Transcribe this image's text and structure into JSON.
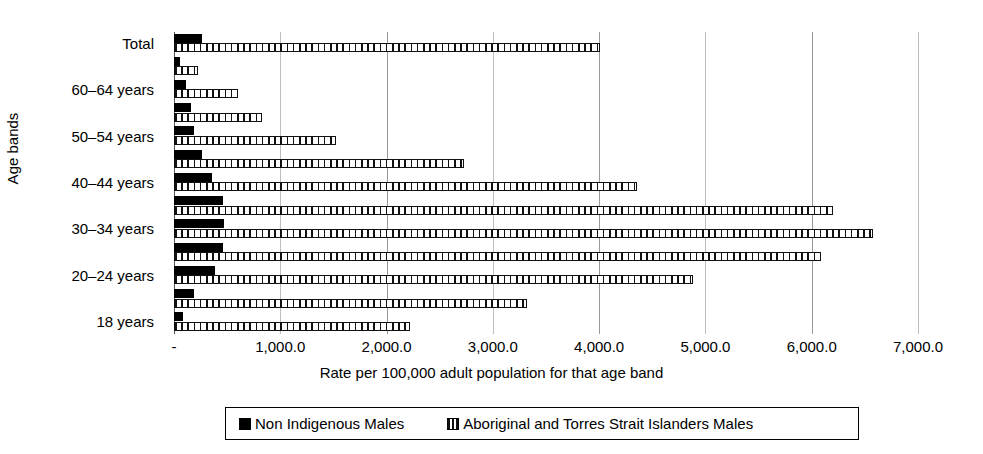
{
  "chart_data": {
    "type": "bar",
    "orientation": "horizontal",
    "title": "",
    "xlabel": "Rate per 100,000 adult population for that age band",
    "ylabel": "Age bands",
    "xlim": [
      0,
      7000
    ],
    "xticks": [
      0,
      1000,
      2000,
      3000,
      4000,
      5000,
      6000,
      7000
    ],
    "xticklabels": [
      "-",
      "1,000.0",
      "2,000.0",
      "3,000.0",
      "4,000.0",
      "5,000.0",
      "6,000.0",
      "7,000.0"
    ],
    "grid": true,
    "grid_axis": "x",
    "legend_position": "bottom",
    "categories": [
      "Total",
      "65+ years",
      "60–64 years",
      "55–59 years",
      "50–54 years",
      "45–49 years",
      "40–44 years",
      "35–39 years",
      "30–34 years",
      "25–29 years",
      "20–24 years",
      "19 years",
      "18 years"
    ],
    "visible_category_labels": [
      "Total",
      "",
      "60–64 years",
      "",
      "50–54 years",
      "",
      "40–44 years",
      "",
      "30–34 years",
      "",
      "20–24 years",
      "",
      "18 years"
    ],
    "series": [
      {
        "name": "Non Indigenous Males",
        "style": "solid-black",
        "color": "#000000",
        "values": [
          265,
          56,
          112,
          156,
          190,
          259,
          362,
          462,
          472,
          462,
          384,
          190,
          87
        ]
      },
      {
        "name": "Aboriginal and Torres Strait Islanders Males",
        "style": "vertical-hatch",
        "color": "#ffffff",
        "values": [
          4008,
          230,
          605,
          830,
          1525,
          2725,
          4356,
          6203,
          6578,
          6090,
          4880,
          3320,
          2222
        ]
      }
    ]
  },
  "legend": {
    "entries": [
      {
        "label": "Non Indigenous Males",
        "swatch": "solid"
      },
      {
        "label": "Aboriginal and Torres Strait Islanders Males",
        "swatch": "hatch"
      }
    ]
  },
  "colors": {
    "series_solid": "#000000",
    "series_hatch_line": "#111111",
    "gridline": "#bdbdbd",
    "axis": "#555555",
    "background": "#ffffff"
  }
}
